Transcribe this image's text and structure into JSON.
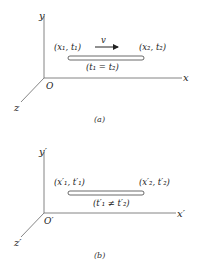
{
  "panels": [
    {
      "id": "a",
      "caption": "(a)",
      "axes": {
        "y": "y",
        "x": "x",
        "z": "z",
        "origin": "O"
      },
      "rod": {
        "left_event": "(x₁, t₁)",
        "right_event": "(x₂, t₂)",
        "condition": "(t₁ = t₂)",
        "velocity_label": "v"
      }
    },
    {
      "id": "b",
      "caption": "(b)",
      "axes": {
        "y": "y′",
        "x": "x′",
        "z": "z′",
        "origin": "O′"
      },
      "rod": {
        "left_event": "(x′₁, t′₁)",
        "right_event": "(x′₂, t′₂)",
        "condition": "(t′₁ ≠ t′₂)"
      }
    }
  ],
  "colors": {
    "line": "#555555",
    "text": "#222222",
    "rod_fill": "#ffffff"
  }
}
